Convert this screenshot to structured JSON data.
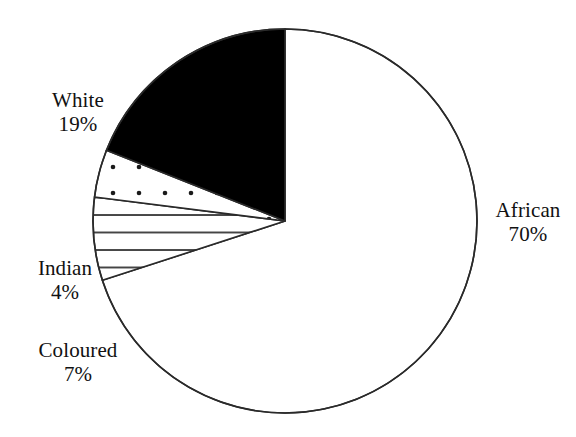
{
  "chart_data": {
    "type": "pie",
    "title": "",
    "subtitle": "",
    "xlabel": "",
    "ylabel": "",
    "legend_position": "none",
    "grid": false,
    "unit": "%",
    "categories": [
      "African",
      "White",
      "Coloured",
      "Indian"
    ],
    "values": [
      70,
      19,
      7,
      4
    ],
    "slices": [
      {
        "name": "African",
        "value": 70,
        "value_label": "70%",
        "fill": "none",
        "fill_color": "#ffffff",
        "outline_color": "#2a2a2a",
        "label_position": "right"
      },
      {
        "name": "White",
        "value": 19,
        "value_label": "19%",
        "fill": "solid",
        "fill_color": "#000000",
        "outline_color": "#2a2a2a",
        "label_position": "upper-left"
      },
      {
        "name": "Indian",
        "value": 4,
        "value_label": "4%",
        "fill": "dotted",
        "fill_color": "#ffffff",
        "outline_color": "#2a2a2a",
        "label_position": "left"
      },
      {
        "name": "Coloured",
        "value": 7,
        "value_label": "7%",
        "fill": "horizontal-hatch",
        "fill_color": "#ffffff",
        "outline_color": "#2a2a2a",
        "label_position": "lower-left"
      }
    ],
    "annotations": []
  },
  "labels": {
    "white": {
      "name": "White",
      "value": "19%"
    },
    "indian": {
      "name": "Indian",
      "value": "4%"
    },
    "coloured": {
      "name": "Coloured",
      "value": "7%"
    },
    "african": {
      "name": "African",
      "value": "70%"
    }
  },
  "colors": {
    "background": "#ffffff",
    "outline": "#2a2a2a",
    "solid_fill": "#000000",
    "text": "#111111"
  }
}
